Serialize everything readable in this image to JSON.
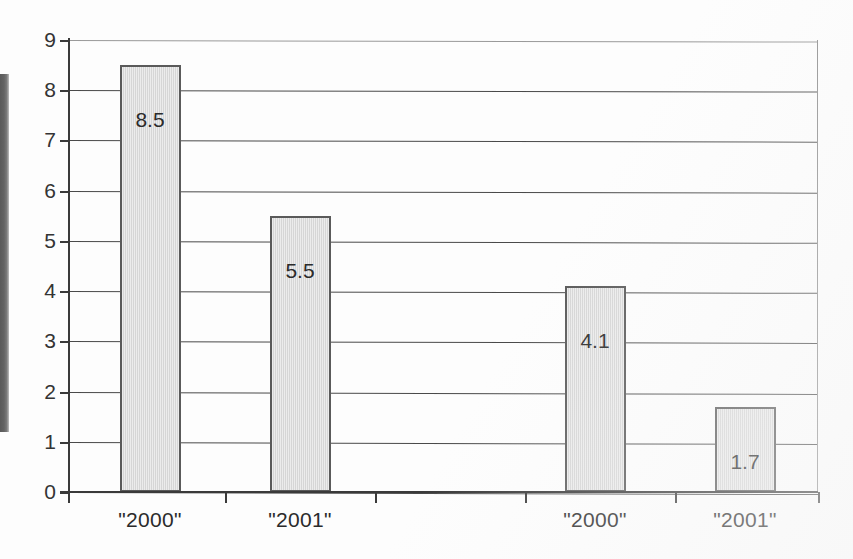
{
  "chart_data": {
    "type": "bar",
    "title": "",
    "subtitle": "",
    "xlabel": "",
    "ylabel": "",
    "categories": [
      "\"2000\"",
      "\"2001\"",
      "\"2000\"",
      "\"2001\""
    ],
    "values": [
      8.5,
      5.5,
      4.1,
      1.7
    ],
    "data_labels": [
      "8.5",
      "5.5",
      "4.1",
      "1.7"
    ],
    "ylim": [
      0,
      9
    ],
    "ytick_labels": [
      "9",
      "8",
      "7",
      "6",
      "5",
      "4",
      "3",
      "2",
      "1",
      "0"
    ],
    "ytick_values": [
      9,
      8,
      7,
      6,
      5,
      4,
      3,
      2,
      1,
      0
    ],
    "grid": true,
    "grid_axis": "y",
    "legend": false,
    "legend_position": "none",
    "series": [
      {
        "name": "",
        "values": [
          8.5,
          5.5,
          4.1,
          1.7
        ]
      }
    ],
    "groups": [
      {
        "label": "",
        "categories": [
          "\"2000\"",
          "\"2001\""
        ],
        "values": [
          8.5,
          5.5
        ]
      },
      {
        "label": "",
        "categories": [
          "\"2000\"",
          "\"2001\""
        ],
        "values": [
          4.1,
          1.7
        ]
      }
    ],
    "colors": {
      "bar_fill": "#d9d9d9",
      "bar_border": "#5a5a5a",
      "gridline": "#4a4a4a",
      "axis": "#3a3a3a",
      "text": "#2b2b2b",
      "background": "#fdfdfd"
    }
  }
}
